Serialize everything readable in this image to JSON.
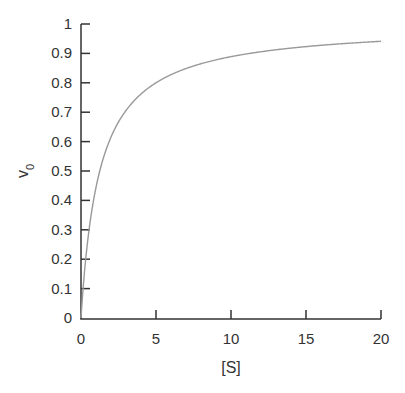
{
  "chart_data": {
    "type": "line",
    "title": "",
    "xlabel": "[S]",
    "ylabel": "v0",
    "ylabel_main": "v",
    "ylabel_sub": "0",
    "xlim": [
      0,
      20
    ],
    "ylim": [
      0,
      1
    ],
    "xticks": [
      0,
      5,
      10,
      15,
      20
    ],
    "yticks": [
      0,
      0.1,
      0.2,
      0.3,
      0.4,
      0.5,
      0.6,
      0.7,
      0.8,
      0.9,
      1
    ],
    "grid": false,
    "legend": null,
    "series": [
      {
        "name": "Michaelis-Menten curve",
        "color": "#999999",
        "model": {
          "Vmax": 1.0,
          "Km": 1.25
        },
        "x": [
          0,
          0.25,
          0.5,
          1,
          1.5,
          2,
          3,
          4,
          5,
          6,
          8,
          10,
          12,
          15,
          18,
          20
        ],
        "y": [
          0,
          0.17,
          0.29,
          0.44,
          0.55,
          0.62,
          0.71,
          0.76,
          0.8,
          0.83,
          0.86,
          0.89,
          0.91,
          0.92,
          0.94,
          0.94
        ]
      }
    ]
  },
  "colors": {
    "axis": "#333333",
    "curve": "#999999",
    "background": "#ffffff"
  }
}
